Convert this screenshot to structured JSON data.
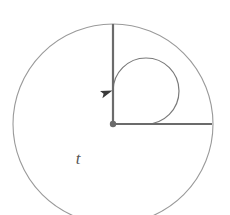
{
  "figure": {
    "title": "Angle t drawn in standard position inside a circle",
    "canvas": {
      "width": 230,
      "height": 215,
      "background": "#ffffff"
    },
    "circle": {
      "name": "outer-circle",
      "cx": 113,
      "cy": 124,
      "r": 100,
      "stroke": "#9a9a9a",
      "stroke_width": 1.1,
      "fill": "none"
    },
    "vertex": {
      "name": "vertex-dot",
      "cx": 113,
      "cy": 124,
      "r": 3.2,
      "fill": "#6b6b6b"
    },
    "rays": [
      {
        "name": "initial-ray-horizontal",
        "x1": 113,
        "y1": 124,
        "x2": 212,
        "y2": 124,
        "angle_deg": 0,
        "stroke": "#6b6b6b",
        "stroke_width": 2.2
      },
      {
        "name": "terminal-ray-vertical",
        "x1": 113,
        "y1": 124,
        "x2": 113,
        "y2": 24,
        "angle_deg": 90,
        "stroke": "#6b6b6b",
        "stroke_width": 2.2
      }
    ],
    "arc": {
      "name": "angle-arc",
      "cx": 113,
      "cy": 124,
      "r": 33,
      "start_angle_deg": 0,
      "end_angle_deg": 90,
      "sweep_deg": 270,
      "direction": "counterclockwise",
      "stroke": "#7a7a7a",
      "stroke_width": 1.2,
      "path": "M 146 124 A 33 33 0 1 0 113 91"
    },
    "arrowhead": {
      "name": "arc-arrowhead",
      "x": 112.5,
      "y": 90.5,
      "rotation_deg": -18,
      "fill": "#3a3a3a",
      "points": "0,0 -12,-3.4 -9.5,0.4 -12,4.2"
    },
    "label": {
      "name": "angle-label-t",
      "text": "t",
      "x": 78,
      "y": 164,
      "color": "#555555",
      "font_size": 17,
      "style": "italic"
    }
  }
}
